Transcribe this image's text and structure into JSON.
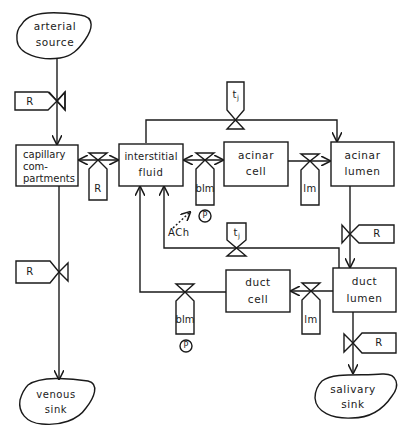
{
  "compartments": {
    "arterial_source": {
      "line1": "arterial",
      "line2": "source"
    },
    "capillary": {
      "line1": "capillary",
      "line2": "com-",
      "line3": "partments"
    },
    "interstitial": {
      "line1": "interstitial",
      "line2": "fluid"
    },
    "acinar_cell": {
      "line1": "acinar",
      "line2": "cell"
    },
    "acinar_lumen": {
      "line1": "acinar",
      "line2": "lumen"
    },
    "duct_cell": {
      "line1": "duct",
      "line2": "cell"
    },
    "duct_lumen": {
      "line1": "duct",
      "line2": "lumen"
    },
    "venous_sink": {
      "line1": "venous",
      "line2": "sink"
    },
    "salivary_sink": {
      "line1": "salivary",
      "line2": "sink"
    }
  },
  "valves": {
    "r_arterial": "R",
    "r_capillary_interstitial": "R",
    "r_venous": "R",
    "blm_acinar": "blm",
    "lm_acinar": "lm",
    "tj_acinar": {
      "main": "t",
      "sub": "j"
    },
    "r_acinar_duct": "R",
    "tj_duct": {
      "main": "t",
      "sub": "j"
    },
    "lm_duct": "lm",
    "blm_duct": "blm",
    "r_salivary": "R"
  },
  "modulators": {
    "p_acinar": "P",
    "p_duct": "P",
    "ach": "ACh"
  },
  "colors": {
    "stroke": "#1a1a1a",
    "background": "#ffffff"
  }
}
